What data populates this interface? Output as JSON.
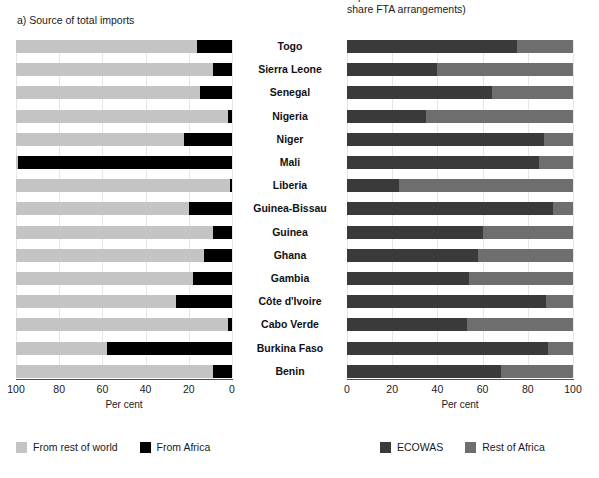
{
  "panels": {
    "left": {
      "title": "a) Source of total imports",
      "xlabel": "Per cent",
      "ticks": [
        "100",
        "80",
        "60",
        "40",
        "20",
        "0"
      ],
      "legend": [
        {
          "label": "From rest of world",
          "color": "#c4c4c4",
          "name": "legend-from-rest-of-world"
        },
        {
          "label": "From Africa",
          "color": "#000000",
          "name": "legend-from-africa"
        }
      ]
    },
    "right": {
      "title": "imports from countries with which states\nshare FTA arrangements)",
      "xlabel": "Per cent",
      "ticks": [
        "0",
        "20",
        "40",
        "60",
        "80",
        "100"
      ],
      "legend": [
        {
          "label": "ECOWAS",
          "color": "#3a3a3a",
          "name": "legend-ecowas"
        },
        {
          "label": "Rest of Africa",
          "color": "#6e6e6e",
          "name": "legend-rest-of-africa"
        }
      ]
    }
  },
  "categories": [
    "Togo",
    "Sierra Leone",
    "Senegal",
    "Nigeria",
    "Niger",
    "Mali",
    "Liberia",
    "Guinea-Bissau",
    "Guinea",
    "Ghana",
    "Gambia",
    "Côte d'Ivoire",
    "Cabo Verde",
    "Burkina Faso",
    "Benin"
  ],
  "colors": {
    "rest_of_world": "#c4c4c4",
    "from_africa": "#000000",
    "ecowas": "#3a3a3a",
    "rest_of_africa": "#6e6e6e",
    "axis": "#4d4d4d",
    "grid": "#e6e6e6",
    "text": "#1a1a1a",
    "background": "#ffffff"
  },
  "chart_data": [
    {
      "type": "bar",
      "orientation": "horizontal",
      "stacked": true,
      "title": "a) Source of total imports",
      "xlabel": "Per cent",
      "ylabel": "",
      "xlim": [
        100,
        0
      ],
      "x_axis_reversed": true,
      "grid": true,
      "legend_position": "bottom-left",
      "categories": [
        "Togo",
        "Sierra Leone",
        "Senegal",
        "Nigeria",
        "Niger",
        "Mali",
        "Liberia",
        "Guinea-Bissau",
        "Guinea",
        "Ghana",
        "Gambia",
        "Côte d'Ivoire",
        "Cabo Verde",
        "Burkina Faso",
        "Benin"
      ],
      "series": [
        {
          "name": "From rest of world",
          "color": "#c4c4c4",
          "values": [
            84,
            91,
            85,
            98,
            78,
            1,
            99,
            80,
            91,
            87,
            82,
            74,
            98,
            42,
            91
          ]
        },
        {
          "name": "From Africa",
          "color": "#000000",
          "values": [
            16,
            9,
            15,
            2,
            22,
            99,
            1,
            20,
            9,
            13,
            18,
            26,
            2,
            58,
            9
          ]
        }
      ]
    },
    {
      "type": "bar",
      "orientation": "horizontal",
      "stacked": true,
      "title": "imports from countries with which states share FTA arrangements)",
      "xlabel": "Per cent",
      "ylabel": "",
      "xlim": [
        0,
        100
      ],
      "x_axis_reversed": false,
      "grid": true,
      "legend_position": "bottom-center",
      "categories": [
        "Togo",
        "Sierra Leone",
        "Senegal",
        "Nigeria",
        "Niger",
        "Mali",
        "Liberia",
        "Guinea-Bissau",
        "Guinea",
        "Ghana",
        "Gambia",
        "Côte d'Ivoire",
        "Cabo Verde",
        "Burkina Faso",
        "Benin"
      ],
      "series": [
        {
          "name": "ECOWAS",
          "color": "#3a3a3a",
          "values": [
            75,
            40,
            64,
            35,
            87,
            85,
            23,
            91,
            60,
            58,
            54,
            88,
            53,
            89,
            68
          ]
        },
        {
          "name": "Rest of Africa",
          "color": "#6e6e6e",
          "values": [
            25,
            60,
            36,
            65,
            13,
            15,
            77,
            9,
            40,
            42,
            46,
            12,
            47,
            11,
            32
          ]
        }
      ]
    }
  ]
}
